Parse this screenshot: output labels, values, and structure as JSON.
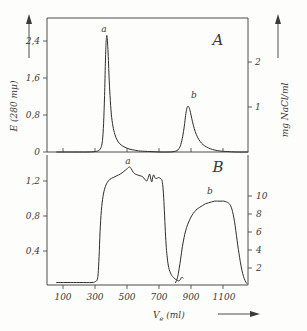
{
  "chart_data": {
    "type": "line",
    "title": "",
    "xlabel": "Ve (ml)",
    "xlabel_main": "V",
    "xlabel_sub": "e",
    "xlabel_unit": "(ml)",
    "xlim": [
      0,
      1250
    ],
    "xticks": [
      100,
      300,
      500,
      700,
      900,
      1100
    ],
    "xticklabels": [
      "100",
      "300",
      "500",
      "700",
      "900",
      "1100"
    ],
    "panels": [
      {
        "id": "A",
        "label": "A",
        "ylabel_left": "E (280 mμ)",
        "ylim_left": [
          0,
          2.9
        ],
        "yticks_left": [
          0,
          0.8,
          1.6,
          2.4
        ],
        "yticklabels_left": [
          "0",
          "0,8",
          "1,6",
          "2,4"
        ],
        "ylabel_right": "mg NaCl/ml",
        "ylim_right": [
          0,
          2.42
        ],
        "yticks_right": [
          1,
          2
        ],
        "yticklabels_right": [
          "1",
          "2"
        ],
        "peaks": [
          {
            "name": "a",
            "center": 372,
            "height": 2.52,
            "width": 34
          },
          {
            "name": "b",
            "center": 872,
            "height": 0.99,
            "width": 70
          }
        ],
        "series": [
          {
            "name": "E280 elution profile A",
            "x": [
              60,
              180,
              250,
              300,
              320,
              335,
              345,
              352,
              358,
              363,
              367,
              370,
              372,
              375,
              378,
              382,
              386,
              392,
              400,
              410,
              422,
              436,
              452,
              470,
              492,
              516,
              545,
              580,
              640,
              700,
              760,
              790,
              808,
              820,
              832,
              844,
              854,
              862,
              870,
              877,
              884,
              892,
              900,
              910,
              922,
              936,
              952,
              970,
              992,
              1016,
              1045,
              1080,
              1120,
              1180,
              1250
            ],
            "y": [
              0,
              0,
              0,
              0.01,
              0.03,
              0.09,
              0.25,
              0.62,
              1.22,
              1.92,
              2.34,
              2.48,
              2.52,
              2.45,
              2.28,
              1.98,
              1.62,
              1.22,
              0.82,
              0.56,
              0.38,
              0.26,
              0.18,
              0.13,
              0.09,
              0.06,
              0.04,
              0.02,
              0.01,
              0.0,
              0.0,
              0.01,
              0.03,
              0.07,
              0.16,
              0.34,
              0.56,
              0.79,
              0.95,
              0.99,
              0.96,
              0.86,
              0.73,
              0.58,
              0.44,
              0.32,
              0.23,
              0.16,
              0.11,
              0.07,
              0.04,
              0.02,
              0.01,
              0.0,
              0.0
            ]
          }
        ]
      },
      {
        "id": "B",
        "label": "B",
        "ylabel_left": "",
        "ylim_left": [
          0,
          1.52
        ],
        "yticks_left": [
          0.4,
          0.8,
          1.2
        ],
        "yticklabels_left": [
          "0,4",
          "0,8",
          "1,2"
        ],
        "ylabel_right": "",
        "ylim_right": [
          0,
          11.6
        ],
        "yticks_right": [
          2,
          4,
          6,
          8,
          10
        ],
        "yticklabels_right": [
          "2",
          "4",
          "6",
          "8",
          "10"
        ],
        "peaks": [
          {
            "name": "a",
            "center": 520,
            "height": 1.36,
            "width": 410
          },
          {
            "name": "b",
            "center": 1030,
            "height": 0.97,
            "width": 380
          }
        ],
        "series": [
          {
            "name": "Activity plateau profile B",
            "x": [
              60,
              200,
              280,
              300,
              312,
              318,
              324,
              330,
              338,
              348,
              360,
              374,
              392,
              412,
              434,
              456,
              478,
              498,
              512,
              524,
              536,
              548,
              562,
              578,
              594,
              608,
              620,
              630,
              638,
              646,
              652,
              658,
              664,
              670,
              676,
              684,
              694,
              704,
              712,
              718,
              724,
              730,
              736,
              742,
              748,
              754,
              760,
              768,
              776,
              786,
              796,
              806,
              814,
              822,
              828,
              834,
              840,
              846
            ],
            "y": [
              0.04,
              0.04,
              0.04,
              0.05,
              0.07,
              0.14,
              0.34,
              0.62,
              0.86,
              1.02,
              1.12,
              1.18,
              1.22,
              1.24,
              1.26,
              1.28,
              1.31,
              1.34,
              1.36,
              1.34,
              1.3,
              1.28,
              1.27,
              1.26,
              1.25,
              1.22,
              1.2,
              1.24,
              1.28,
              1.22,
              1.19,
              1.25,
              1.27,
              1.24,
              1.23,
              1.23,
              1.24,
              1.23,
              1.22,
              1.18,
              1.06,
              0.86,
              0.62,
              0.44,
              0.32,
              0.24,
              0.19,
              0.15,
              0.12,
              0.1,
              0.08,
              0.07,
              0.06,
              0.06,
              0.07,
              0.09,
              0.1,
              0.09
            ]
          },
          {
            "name": "Second plateau profile B",
            "x": [
              800,
              812,
              822,
              832,
              842,
              852,
              862,
              874,
              888,
              902,
              918,
              934,
              950,
              968,
              986,
              1004,
              1022,
              1042,
              1062,
              1082,
              1100,
              1116,
              1128,
              1138,
              1146,
              1154,
              1162,
              1170,
              1178,
              1186,
              1194,
              1202,
              1212,
              1222,
              1232,
              1242
            ],
            "y": [
              0.04,
              0.1,
              0.2,
              0.32,
              0.45,
              0.55,
              0.63,
              0.7,
              0.76,
              0.81,
              0.85,
              0.88,
              0.9,
              0.92,
              0.94,
              0.95,
              0.96,
              0.97,
              0.97,
              0.97,
              0.97,
              0.96,
              0.95,
              0.93,
              0.9,
              0.85,
              0.78,
              0.69,
              0.58,
              0.47,
              0.37,
              0.28,
              0.18,
              0.11,
              0.06,
              0.03
            ]
          }
        ]
      }
    ],
    "annotations": [
      {
        "text": "a",
        "panel": "A"
      },
      {
        "text": "b",
        "panel": "A"
      },
      {
        "text": "a",
        "panel": "B"
      },
      {
        "text": "b",
        "panel": "B"
      },
      {
        "text": "A",
        "panel": "A"
      },
      {
        "text": "B",
        "panel": "B"
      }
    ],
    "grid": false,
    "legend": "none"
  },
  "labels": {
    "panel_a": "A",
    "panel_b": "B",
    "peak_a_top": "a",
    "peak_b_top": "b",
    "peak_a_bottom": "a",
    "peak_b_bottom": "b",
    "y_left_title": "E (280 mμ)",
    "y_right_title": "mg NaCl/ml",
    "x_title_main": "V",
    "x_title_sub": "e",
    "x_title_unit": "(ml)",
    "yA_0": "0",
    "yA_08": "0,8",
    "yA_16": "1,6",
    "yA_24": "2,4",
    "yAr_1": "1",
    "yAr_2": "2",
    "yB_04": "0,4",
    "yB_08": "0,8",
    "yB_12": "1,2",
    "yBr_2": "2",
    "yBr_4": "4",
    "yBr_6": "6",
    "yBr_8": "8",
    "yBr_10": "10",
    "x_100": "100",
    "x_300": "300",
    "x_500": "500",
    "x_700": "700",
    "x_900": "900",
    "x_1100": "1100"
  }
}
